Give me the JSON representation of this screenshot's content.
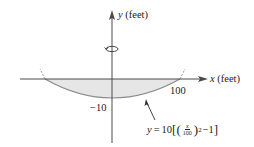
{
  "diagram": {
    "axes": {
      "y_label_var": "y",
      "y_label_unit": "(feet)",
      "x_label_var": "x",
      "x_label_unit": "(feet)"
    },
    "tick_labels": {
      "y_min": "−10",
      "x_max": "100"
    },
    "equation": {
      "lhs": "y",
      "equals": "=",
      "coef": "10",
      "open_bracket": "[",
      "open_paren": "(",
      "frac_num": "x",
      "frac_den": "100",
      "close_paren": ")",
      "exponent": "2",
      "minus_one": "−1",
      "close_bracket": "]"
    },
    "rotation_icon": "rotation-arrow-icon",
    "colors": {
      "axis": "#4a4a4a",
      "curve": "#8a8a8a",
      "shade": "#e6e6e6",
      "text": "#222222"
    }
  }
}
